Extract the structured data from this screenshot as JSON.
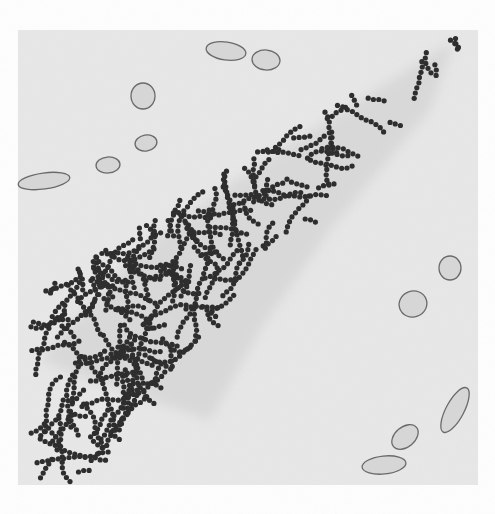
{
  "figure": {
    "colors": {
      "page": "#ffffff",
      "panel": "#e9e9e9",
      "shade": "#cfcfcf",
      "dot": "#2e2e2e",
      "cell_fill": "#d6d6d6",
      "cell_stroke": "#6a6a6a"
    },
    "panel": {
      "x": 18,
      "y": 30,
      "w": 220,
      "h": 215
    },
    "cells": [
      {
        "cx": 226,
        "cy": 51,
        "rx": 20,
        "ry": 9,
        "rot": 8
      },
      {
        "cx": 266,
        "cy": 60,
        "rx": 14,
        "ry": 10,
        "rot": 5
      },
      {
        "cx": 143,
        "cy": 96,
        "rx": 12,
        "ry": 13,
        "rot": 0
      },
      {
        "cx": 146,
        "cy": 143,
        "rx": 11,
        "ry": 8,
        "rot": -10
      },
      {
        "cx": 108,
        "cy": 165,
        "rx": 12,
        "ry": 8,
        "rot": -5
      },
      {
        "cx": 44,
        "cy": 181,
        "rx": 26,
        "ry": 8,
        "rot": -8
      },
      {
        "cx": 450,
        "cy": 268,
        "rx": 11,
        "ry": 12,
        "rot": 0
      },
      {
        "cx": 413,
        "cy": 304,
        "rx": 14,
        "ry": 13,
        "rot": -20
      },
      {
        "cx": 455,
        "cy": 410,
        "rx": 25,
        "ry": 9,
        "rot": -62
      },
      {
        "cx": 405,
        "cy": 437,
        "rx": 15,
        "ry": 10,
        "rot": -40
      },
      {
        "cx": 384,
        "cy": 465,
        "rx": 22,
        "ry": 9,
        "rot": -6
      }
    ]
  }
}
